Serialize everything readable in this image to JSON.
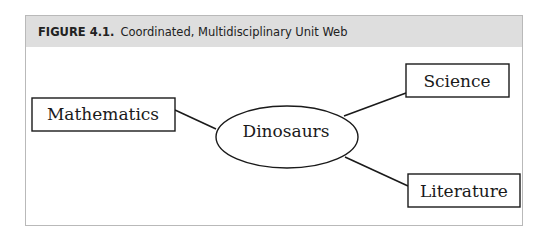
{
  "figure": {
    "number": "FIGURE 4.1.",
    "title": "Coordinated, Multidisciplinary Unit Web"
  },
  "diagram": {
    "center": {
      "label": "Dinosaurs",
      "shape": "ellipse"
    },
    "nodes": [
      {
        "id": "mathematics",
        "label": "Mathematics",
        "shape": "rectangle"
      },
      {
        "id": "science",
        "label": "Science",
        "shape": "rectangle"
      },
      {
        "id": "literature",
        "label": "Literature",
        "shape": "rectangle"
      }
    ],
    "edges": [
      {
        "from": "Dinosaurs",
        "to": "Mathematics"
      },
      {
        "from": "Dinosaurs",
        "to": "Science"
      },
      {
        "from": "Dinosaurs",
        "to": "Literature"
      }
    ]
  },
  "colors": {
    "header_bg": "#dedede",
    "frame_border": "#b9b9b9",
    "ink": "#1a1a1a"
  }
}
